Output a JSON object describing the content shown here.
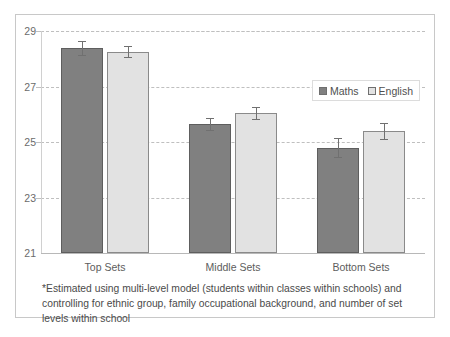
{
  "chart_data": {
    "type": "bar",
    "title": "",
    "xlabel": "",
    "ylabel": "",
    "ylim": [
      21,
      29
    ],
    "yticks": [
      21,
      23,
      25,
      27,
      29
    ],
    "grid": true,
    "legend_position": "top-right",
    "categories": [
      "Top Sets",
      "Middle Sets",
      "Bottom Sets"
    ],
    "series": [
      {
        "name": "Maths",
        "color": "#808080",
        "values": [
          28.4,
          25.65,
          24.8
        ],
        "errors": [
          0.25,
          0.22,
          0.35
        ]
      },
      {
        "name": "English",
        "color": "#e2e2e2",
        "values": [
          28.25,
          26.05,
          25.4
        ],
        "errors": [
          0.2,
          0.22,
          0.3
        ]
      }
    ],
    "footnote": "*Estimated using multi-level model (students within classes within schools) and controlling for ethnic group, family occupational background, and number of set levels within school"
  },
  "legend": {
    "items": [
      {
        "label": "Maths"
      },
      {
        "label": "English"
      }
    ]
  }
}
